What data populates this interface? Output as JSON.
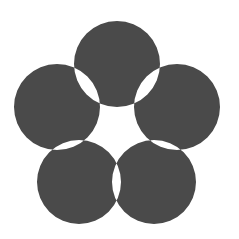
{
  "diagram": {
    "type": "five-circle-flower",
    "background": "#ffffff",
    "fill_color": "#4a4a4a",
    "overlap_color": "#ffffff",
    "circles": [
      {
        "name": "top",
        "cx": 117,
        "cy": 64,
        "r": 43
      },
      {
        "name": "right",
        "cx": 177,
        "cy": 107,
        "r": 43
      },
      {
        "name": "bottom-right",
        "cx": 154,
        "cy": 182,
        "r": 42
      },
      {
        "name": "bottom-left",
        "cx": 79,
        "cy": 182,
        "r": 42
      },
      {
        "name": "left",
        "cx": 57,
        "cy": 107,
        "r": 43
      }
    ]
  }
}
